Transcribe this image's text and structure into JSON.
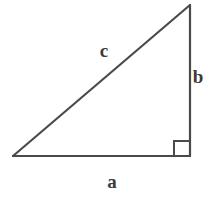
{
  "figure": {
    "kind": "right-triangle-geometry-diagram",
    "background_color": "#ffffff",
    "stroke_color": "#4a4a4a",
    "label_color": "#3b3b3b",
    "stroke_width": 2,
    "canvas": {
      "width": 219,
      "height": 201
    }
  },
  "triangle": {
    "vertices": {
      "left": {
        "x": 13,
        "y": 156
      },
      "bottom_right": {
        "x": 190,
        "y": 156
      },
      "apex": {
        "x": 190,
        "y": 5
      }
    },
    "points_attr": "13,156 190,156 190,5"
  },
  "right_angle_marker": {
    "name": "right-angle-square",
    "x": 174,
    "y": 140,
    "size": 15,
    "path_attr": "M 174 156 L 174 141 L 189 141"
  },
  "labels": {
    "hypotenuse": "c",
    "vertical_leg": "b",
    "horizontal_leg": "a"
  }
}
